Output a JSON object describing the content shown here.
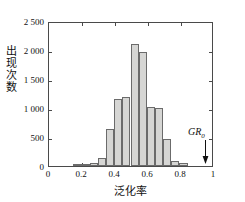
{
  "figure": {
    "background": "#ffffff",
    "axis_color": "#4a4a4a",
    "bar_fill": "#d6d6d4",
    "bar_edge": "#6b6b6b"
  },
  "axes": {
    "x_title": "泛化率",
    "y_title_chars": [
      "出",
      "现",
      "次",
      "数"
    ],
    "x_ticklabels": [
      "0",
      "0.2",
      "0.4",
      "0.6",
      "0.8",
      "1"
    ],
    "y_ticklabels": [
      "0",
      "500",
      "1 000",
      "1 500",
      "2 000",
      "2 500"
    ]
  },
  "annotation": {
    "gr0_text": "GR",
    "gr0_sub": "0",
    "arrow_name": "down-arrow",
    "arrow_x_value": 0.95
  },
  "chart_data": {
    "type": "bar",
    "title": "",
    "xlabel": "泛化率",
    "ylabel": "出现次数",
    "xlim": [
      0,
      1
    ],
    "ylim": [
      0,
      2500
    ],
    "xticks": [
      0,
      0.2,
      0.4,
      0.6,
      0.8,
      1
    ],
    "yticks": [
      0,
      500,
      1000,
      1500,
      2000,
      2500
    ],
    "xticklabels": [
      "0",
      "0.2",
      "0.4",
      "0.6",
      "0.8",
      "1"
    ],
    "yticklabels": [
      "0",
      "500",
      "1 000",
      "1 500",
      "2 000",
      "2 500"
    ],
    "grid": false,
    "legend": null,
    "bin_width": 0.05,
    "bin_edges": [
      0.15,
      0.2,
      0.25,
      0.3,
      0.35,
      0.4,
      0.45,
      0.5,
      0.55,
      0.6,
      0.65,
      0.7,
      0.75,
      0.8,
      0.85
    ],
    "bin_centers": [
      0.175,
      0.225,
      0.275,
      0.325,
      0.375,
      0.425,
      0.475,
      0.525,
      0.575,
      0.625,
      0.675,
      0.725,
      0.775,
      0.825
    ],
    "values": [
      10,
      20,
      60,
      140,
      650,
      1180,
      1210,
      2130,
      1990,
      1040,
      1010,
      470,
      95,
      60
    ],
    "annotations": [
      {
        "text": "GR0",
        "x": 0.95,
        "y": 0,
        "style": "down-arrow"
      }
    ]
  }
}
